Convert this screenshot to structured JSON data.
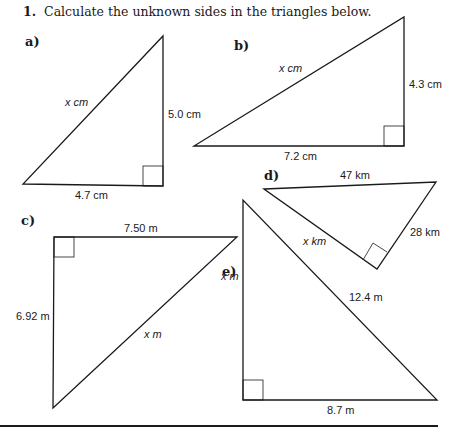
{
  "question": {
    "number": "1.",
    "text": "Calculate the unknown sides in the triangles below."
  },
  "triangles": [
    {
      "part": "a)",
      "hypotenuse": "x cm",
      "sides": [
        "5.0 cm",
        "4.7 cm"
      ]
    },
    {
      "part": "b)",
      "hypotenuse": "x cm",
      "sides": [
        "4.3 cm",
        "7.2 cm"
      ]
    },
    {
      "part": "c)",
      "hypotenuse": "x m",
      "sides": [
        "7.50 m",
        "6.92 m"
      ]
    },
    {
      "part": "d)",
      "hypotenuse": "47 km",
      "sides": [
        "x km",
        "28 km"
      ]
    },
    {
      "part": "e)",
      "hypotenuse": "12.4 m",
      "sides": [
        "x m",
        "8.7 m"
      ]
    }
  ]
}
